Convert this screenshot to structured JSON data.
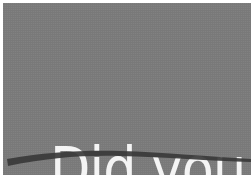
{
  "banner": {
    "line1": "Did you",
    "line2": "know?",
    "colors": {
      "background": "#8b8b8b",
      "text": "#f4f4f4",
      "swoosh": "#3a3a3a"
    },
    "decoration": "curved-underline-swoosh"
  }
}
